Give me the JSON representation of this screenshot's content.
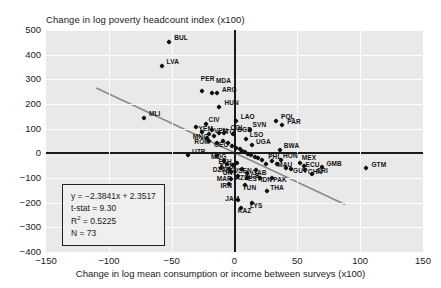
{
  "chart_data": {
    "type": "scatter",
    "title": "",
    "ylabel": "Change in log poverty headcount index (x100)",
    "xlabel": "Change in log mean consumption or income between surveys (x100)",
    "xlim": [
      -150,
      150
    ],
    "ylim": [
      -400,
      500
    ],
    "xticks": [
      -150,
      -100,
      -50,
      0,
      50,
      100,
      150
    ],
    "yticks": [
      500,
      400,
      300,
      200,
      100,
      0,
      -100,
      -200,
      -300,
      -400
    ],
    "grid": true,
    "legend": "none",
    "regression": {
      "equation": "y = −2.3841x + 2.3517",
      "tstat_label": "t-stat = 9.30",
      "r2_label_prefix": "R",
      "r2_label_sup": "2",
      "r2_label_value": " = 0.5225",
      "n_label": "N = 73",
      "slope": -2.3841,
      "intercept": 2.3517,
      "tstat": 9.3,
      "r2": 0.5225,
      "n": 73
    },
    "points": [
      {
        "label": "BUL",
        "x": -52,
        "y": 450,
        "lx": 5,
        "ly": -4
      },
      {
        "label": "LVA",
        "x": -58,
        "y": 355,
        "lx": 5,
        "ly": -4
      },
      {
        "label": "PER",
        "x": -26,
        "y": 253,
        "lx": -1,
        "ly": -12
      },
      {
        "label": "MDA",
        "x": -18,
        "y": 243,
        "lx": 4,
        "ly": -12
      },
      {
        "label": "ARG",
        "x": -14,
        "y": 243,
        "lx": 5,
        "ly": -3
      },
      {
        "label": "HUN",
        "x": -12,
        "y": 188,
        "lx": 5,
        "ly": -4
      },
      {
        "label": "MLI",
        "x": -72,
        "y": 143,
        "lx": 5,
        "ly": -4
      },
      {
        "label": "CIV",
        "x": -23,
        "y": 118,
        "lx": 3,
        "ly": -4
      },
      {
        "label": "LAO",
        "x": 1,
        "y": 130,
        "lx": 5,
        "ly": -4
      },
      {
        "label": "YEM",
        "x": -31,
        "y": 105,
        "lx": 3,
        "ly": 2
      },
      {
        "label": "POL",
        "x": 33,
        "y": 133,
        "lx": 5,
        "ly": -4
      },
      {
        "label": "PAR",
        "x": 38,
        "y": 115,
        "lx": 5,
        "ly": -3
      },
      {
        "label": "VEN",
        "x": -18,
        "y": 95,
        "lx": 2,
        "ly": 1
      },
      {
        "label": "TTO",
        "x": -12,
        "y": 83,
        "lx": 2,
        "ly": -1
      },
      {
        "label": "COL",
        "x": -8,
        "y": 82,
        "lx": 6,
        "ly": -5
      },
      {
        "label": "SVN",
        "x": 12,
        "y": 95,
        "lx": 3,
        "ly": -5
      },
      {
        "label": "MNG",
        "x": -22,
        "y": 63,
        "lx": -14,
        "ly": -1
      },
      {
        "label": "ROM",
        "x": -20,
        "y": 50,
        "lx": -15,
        "ly": 1
      },
      {
        "label": "GEO",
        "x": -14,
        "y": 42,
        "lx": -3,
        "ly": 2
      },
      {
        "label": "BGD",
        "x": -1,
        "y": 78,
        "lx": 4,
        "ly": -4
      },
      {
        "label": "LSO",
        "x": 9,
        "y": 60,
        "lx": 4,
        "ly": -4
      },
      {
        "label": "UGA",
        "x": 14,
        "y": 35,
        "lx": 4,
        "ly": -3
      },
      {
        "label": "UZB",
        "x": -37,
        "y": -5,
        "lx": 4,
        "ly": -3
      },
      {
        "label": "MDG",
        "x": -14,
        "y": -10,
        "lx": -6,
        "ly": 1
      },
      {
        "label": "BWA",
        "x": 36,
        "y": 13,
        "lx": 4,
        "ly": -4
      },
      {
        "label": "ETH",
        "x": -8,
        "y": -30,
        "lx": -6,
        "ly": 1
      },
      {
        "label": "KEN",
        "x": -6,
        "y": -45,
        "lx": -7,
        "ly": 2
      },
      {
        "label": "DZA",
        "x": -11,
        "y": -60,
        "lx": -8,
        "ly": 2
      },
      {
        "label": "LTU",
        "x": -4,
        "y": -62,
        "lx": -4,
        "ly": 2
      },
      {
        "label": "SEN",
        "x": 6,
        "y": -62,
        "lx": -4,
        "ly": 2
      },
      {
        "label": "GAB",
        "x": 17,
        "y": -68,
        "lx": -4,
        "ly": 3
      },
      {
        "label": "URY",
        "x": -3,
        "y": -75,
        "lx": -8,
        "ly": 1
      },
      {
        "label": "ALB",
        "x": 10,
        "y": -78,
        "lx": -1,
        "ly": 3
      },
      {
        "label": "AZE",
        "x": 3,
        "y": -92,
        "lx": -3,
        "ly": 2
      },
      {
        "label": "MAR",
        "x": -3,
        "y": -105,
        "lx": -14,
        "ly": 0
      },
      {
        "label": "EST",
        "x": 10,
        "y": -98,
        "lx": 1,
        "ly": 1
      },
      {
        "label": "IDN",
        "x": 20,
        "y": -100,
        "lx": 1,
        "ly": 2
      },
      {
        "label": "PAK",
        "x": 30,
        "y": -100,
        "lx": 1,
        "ly": 2
      },
      {
        "label": "IRN",
        "x": -4,
        "y": -125,
        "lx": -9,
        "ly": 2
      },
      {
        "label": "TUN",
        "x": 8,
        "y": -128,
        "lx": -2,
        "ly": 3
      },
      {
        "label": "THA",
        "x": 26,
        "y": -152,
        "lx": 3,
        "ly": -3
      },
      {
        "label": "JAM",
        "x": 3,
        "y": -190,
        "lx": -13,
        "ly": -1
      },
      {
        "label": "LYS",
        "x": 14,
        "y": -200,
        "lx": -2,
        "ly": 3
      },
      {
        "label": "KAZ",
        "x": 5,
        "y": -222,
        "lx": -3,
        "ly": 3
      },
      {
        "label": "PHL",
        "x": 30,
        "y": -30,
        "lx": -4,
        "ly": -4
      },
      {
        "label": "HON",
        "x": 37,
        "y": -28,
        "lx": 2,
        "ly": -4
      },
      {
        "label": "MEX",
        "x": 52,
        "y": -38,
        "lx": 2,
        "ly": -5
      },
      {
        "label": "MAU",
        "x": 34,
        "y": -45,
        "lx": 0,
        "ly": 1
      },
      {
        "label": "ECU",
        "x": 55,
        "y": -52,
        "lx": 2,
        "ly": -1
      },
      {
        "label": "GMB",
        "x": 70,
        "y": -55,
        "lx": 4,
        "ly": -3
      },
      {
        "label": "GUY",
        "x": 45,
        "y": -65,
        "lx": 2,
        "ly": 2
      },
      {
        "label": "CHN",
        "x": 56,
        "y": -66,
        "lx": 3,
        "ly": 2
      },
      {
        "label": "CRI",
        "x": 62,
        "y": -82,
        "lx": 4,
        "ly": -3
      },
      {
        "label": "GTM",
        "x": 105,
        "y": -58,
        "lx": 5,
        "ly": -3
      },
      {
        "label": "",
        "x": -2,
        "y": 30,
        "lx": 0,
        "ly": 0
      },
      {
        "label": "",
        "x": 1,
        "y": 22,
        "lx": 0,
        "ly": 0
      },
      {
        "label": "",
        "x": 4,
        "y": 18,
        "lx": 0,
        "ly": 0
      },
      {
        "label": "",
        "x": 6,
        "y": 10,
        "lx": 0,
        "ly": 0
      },
      {
        "label": "",
        "x": 8,
        "y": 5,
        "lx": 0,
        "ly": 0
      },
      {
        "label": "",
        "x": 11,
        "y": -2,
        "lx": 0,
        "ly": 0
      },
      {
        "label": "",
        "x": 13,
        "y": -8,
        "lx": 0,
        "ly": 0
      },
      {
        "label": "",
        "x": 16,
        "y": -14,
        "lx": 0,
        "ly": 0
      },
      {
        "label": "",
        "x": 19,
        "y": -20,
        "lx": 0,
        "ly": 0
      },
      {
        "label": "",
        "x": 22,
        "y": -25,
        "lx": 0,
        "ly": 0
      },
      {
        "label": "",
        "x": -5,
        "y": 40,
        "lx": 0,
        "ly": 0
      },
      {
        "label": "",
        "x": -9,
        "y": 52,
        "lx": 0,
        "ly": 0
      },
      {
        "label": "",
        "x": -16,
        "y": 70,
        "lx": 0,
        "ly": 0
      },
      {
        "label": "",
        "x": -20,
        "y": 78,
        "lx": 0,
        "ly": 0
      },
      {
        "label": "",
        "x": -26,
        "y": 88,
        "lx": 0,
        "ly": 0
      },
      {
        "label": "",
        "x": 2,
        "y": -40,
        "lx": 0,
        "ly": 0
      },
      {
        "label": "",
        "x": -1,
        "y": -48,
        "lx": 0,
        "ly": 0
      },
      {
        "label": "",
        "x": 25,
        "y": -45,
        "lx": 0,
        "ly": 0
      },
      {
        "label": "",
        "x": 41,
        "y": -60,
        "lx": 0,
        "ly": 0
      }
    ]
  }
}
